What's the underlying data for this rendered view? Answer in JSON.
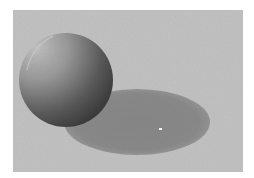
{
  "figure": {
    "background_color": "#c3c3c3",
    "sphere": {
      "highlight_color": "#bdbdbd",
      "mid_color": "#7a7a7a",
      "shade_color": "#3a3a3a",
      "light_direction": "upper-left"
    },
    "shadow": {
      "color": "#8a8a8a",
      "shape": "ellipse"
    },
    "specular_speck_color": "#f4f4f4"
  },
  "caption": {
    "text": ""
  }
}
